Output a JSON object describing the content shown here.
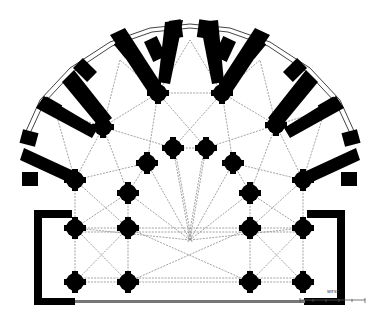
{
  "diagram": {
    "type": "architectural-floor-plan",
    "colors": {
      "ink": "#000000",
      "paper": "#ffffff",
      "hatch": "#8a8a8a"
    },
    "apse_center": [
      190,
      212
    ],
    "radiating_chapels": 9,
    "piers": {
      "outer_ring": [
        [
          158,
          93
        ],
        [
          222,
          93
        ],
        [
          103,
          127
        ],
        [
          276,
          125
        ],
        [
          75,
          180
        ],
        [
          303,
          180
        ]
      ],
      "hemicycle": [
        [
          173,
          148
        ],
        [
          206,
          148
        ],
        [
          147,
          163
        ],
        [
          233,
          163
        ],
        [
          128,
          193
        ],
        [
          250,
          193
        ]
      ],
      "choir_row_1": [
        [
          75,
          228
        ],
        [
          128,
          228
        ],
        [
          250,
          228
        ],
        [
          303,
          228
        ]
      ],
      "choir_row_2": [
        [
          75,
          282
        ],
        [
          128,
          282
        ],
        [
          250,
          282
        ],
        [
          303,
          282
        ]
      ]
    }
  },
  "caption": {
    "text": "WEST"
  },
  "scale_bar": {
    "ticks": [
      "0",
      "2",
      "4",
      "6",
      "8",
      "10"
    ],
    "unit": "m"
  }
}
